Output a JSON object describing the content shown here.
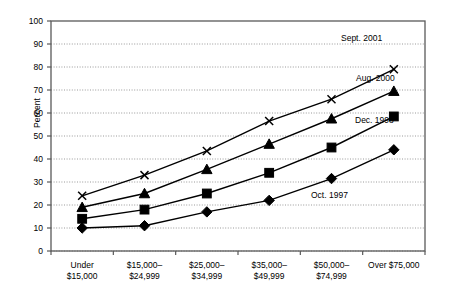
{
  "chart_data": {
    "type": "line",
    "title": "",
    "xlabel": "",
    "ylabel": "Percent",
    "ylim": [
      0,
      100
    ],
    "yticks": [
      0,
      10,
      20,
      30,
      40,
      50,
      60,
      70,
      80,
      90,
      100
    ],
    "ytick_labels": [
      "0",
      "10",
      "20",
      "30",
      "40",
      "50",
      "60",
      "70",
      "80",
      "90",
      "100"
    ],
    "grid": true,
    "legend_position": "inline-right-of-series",
    "categories": [
      "Under\n$15,000",
      "$15,000–\n$24,999",
      "$25,000–\n$34,999",
      "$35,000–\n$49,999",
      "$50,000–\n$74,999",
      "Over $75,000"
    ],
    "series": [
      {
        "name": "Oct. 1997",
        "marker": "diamond",
        "values": [
          10,
          11,
          17,
          22,
          31.5,
          44
        ]
      },
      {
        "name": "Dec. 1998",
        "marker": "square",
        "values": [
          14,
          18,
          25,
          34,
          45,
          58.5
        ]
      },
      {
        "name": "Aug. 2000",
        "marker": "triangle",
        "values": [
          19,
          25,
          35.5,
          46.5,
          57.5,
          69.5
        ]
      },
      {
        "name": "Sept. 2001",
        "marker": "x",
        "values": [
          24,
          33,
          43.5,
          56.5,
          66,
          79
        ]
      }
    ],
    "annotations": [
      {
        "text": "Sept. 2001",
        "x": 341,
        "y": 33
      },
      {
        "text": "Aug. 2000",
        "x": 356,
        "y": 73
      },
      {
        "text": "Dec. 1998",
        "x": 355,
        "y": 115
      },
      {
        "text": "Oct. 1997",
        "x": 311,
        "y": 190
      }
    ],
    "colors": {
      "line": "#000000",
      "grid": "#808080",
      "axis": "#595959",
      "background": "#ffffff"
    }
  }
}
